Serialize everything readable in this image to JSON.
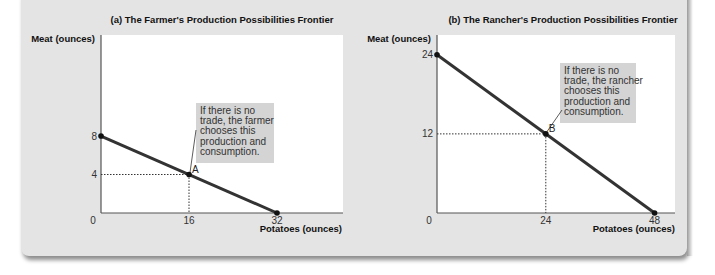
{
  "colors": {
    "panel_bg": "#e4e4e4",
    "plot_bg": "#ffffff",
    "frontier": "#333333",
    "annotation_bg": "#d4d4d4",
    "guide": "#333333"
  },
  "chart_data": [
    {
      "type": "line",
      "title": "(a) The Farmer's Production Possibilities Frontier",
      "xlabel": "Potatoes (ounces)",
      "ylabel": "Meat (ounces)",
      "xlim": [
        0,
        44
      ],
      "ylim": [
        0,
        18.5
      ],
      "grid": false,
      "xticks": [
        0,
        16,
        32
      ],
      "yticks": [
        4,
        8
      ],
      "tick_labels": {
        "origin": "0",
        "x": [
          "16",
          "32"
        ],
        "y": [
          "4",
          "8"
        ]
      },
      "series": [
        {
          "name": "Farmer PPF",
          "points": [
            [
              0,
              8
            ],
            [
              32,
              0
            ]
          ]
        }
      ],
      "marked_point": {
        "label": "A",
        "x": 16,
        "y": 4
      },
      "annotation": {
        "lines": [
          "If there is no",
          "trade, the farmer",
          "chooses this",
          "production and",
          "consumption."
        ]
      }
    },
    {
      "type": "line",
      "title": "(b) The Rancher's Production Possibilities Frontier",
      "xlabel": "Potatoes (ounces)",
      "ylabel": "Meat (ounces)",
      "xlim": [
        0,
        52.5
      ],
      "ylim": [
        0,
        27
      ],
      "grid": false,
      "xticks": [
        0,
        24,
        48
      ],
      "yticks": [
        12,
        24
      ],
      "tick_labels": {
        "origin": "0",
        "x": [
          "24",
          "48"
        ],
        "y": [
          "12",
          "24"
        ]
      },
      "series": [
        {
          "name": "Rancher PPF",
          "points": [
            [
              0,
              24
            ],
            [
              48,
              0
            ]
          ]
        }
      ],
      "marked_point": {
        "label": "B",
        "x": 24,
        "y": 12
      },
      "annotation": {
        "lines": [
          "If there is no",
          "trade, the rancher",
          "chooses this",
          "production and",
          "consumption."
        ]
      }
    }
  ]
}
